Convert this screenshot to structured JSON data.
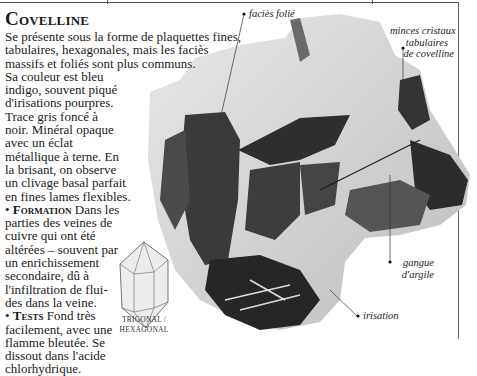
{
  "page": {
    "title": "Covelline",
    "body_lines": [
      "Se présente sous la forme de plaquettes fines,",
      "tabulaires, hexagonales, mais les faciès",
      "massifs et foliés sont plus communs.",
      "Sa couleur est bleu",
      "indigo, souvent piqué",
      "d'irisations pourpres.",
      "Trace gris foncé à",
      "noir. Minéral opaque",
      "avec un éclat",
      "métallique à terne. En",
      "la brisant, on observe",
      "un clivage basal parfait",
      "en fines lames flexibles."
    ],
    "sections": [
      {
        "heading": "Formation",
        "lines": [
          "Dans les",
          "parties des veines de",
          "cuivre qui ont été",
          "altérées – souvent par",
          "un enrichissement",
          "secondaire, dû à",
          "l'infiltration de flui-",
          "des dans la veine."
        ]
      },
      {
        "heading": "Tests",
        "lines": [
          "Fond très",
          "facilement, avec une",
          "flamme bleutée. Se",
          "dissout dans l'acide",
          "chlorhydrique."
        ]
      }
    ],
    "bullet": "•",
    "crystal_system": [
      "TRIGONAL /",
      "HEXAGONAL"
    ]
  },
  "annotations": {
    "facies_folie": "faciès folié",
    "minces_cristaux": [
      "minces cristaux",
      "tabulaires",
      "de covelline"
    ],
    "gangue": [
      "gangue",
      "d'argile"
    ],
    "irisation": "irisation"
  },
  "colors": {
    "text": "#1a1a1a",
    "rule": "#555555",
    "mineral_dark": "#2b2b2b",
    "gangue_light": "#d9d9d9"
  }
}
